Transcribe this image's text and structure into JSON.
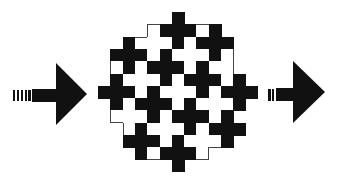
{
  "diagram": {
    "colors": {
      "ink": "#111111",
      "paper": "#ffffff",
      "outline": "#444444"
    },
    "input_arrow": {
      "direction": "right",
      "striped_tail": true
    },
    "output_arrow": {
      "direction": "right",
      "broken_tail": true
    },
    "tiling": {
      "shape": "plus-cross",
      "cell_size_px": 12.3,
      "cols": 13,
      "rows": 13,
      "legend": {
        "B": "black cross cell",
        "W": "white cross cell",
        ".": "outside"
      },
      "grid": [
        "......B......",
        "....WBBBWB...",
        "..BWWWBWBBB..",
        ".BBBWBWWWBW..",
        ".WBWBBBWBWW..",
        ".BWWWBWBBBWB.",
        "BBBWBWWWBWBBB",
        ".BWBBBWBWWWB.",
        ".WWWBWBBBWB..",
        "..WBWWWBWBBB.",
        "..BBBWBWWWB..",
        "...BWBBBW....",
        "......B......"
      ]
    }
  }
}
